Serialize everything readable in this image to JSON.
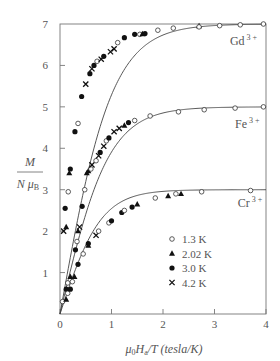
{
  "chart_data": {
    "type": "scatter",
    "title": "",
    "xlabel": "μ0 Ha / T (tesla/K)",
    "ylabel": "M / N μB",
    "xlim": [
      0,
      4
    ],
    "ylim": [
      0,
      7
    ],
    "xticks": [
      0,
      1,
      2,
      3,
      4
    ],
    "yticks": [
      0,
      1,
      2,
      3,
      4,
      5,
      6,
      7
    ],
    "grid": false,
    "legend_position": "lower right (inside)",
    "legend": [
      {
        "label": "1.3 K",
        "marker": "open-circle"
      },
      {
        "label": "2.02 K",
        "marker": "filled-triangle"
      },
      {
        "label": "3.0 K",
        "marker": "filled-circle"
      },
      {
        "label": "4.2 K",
        "marker": "cross"
      }
    ],
    "curves": [
      {
        "name": "Gd 3+",
        "saturation": 7.0,
        "annotation": {
          "text": "Gd",
          "sup": "3 +",
          "x": 3.3,
          "y": 6.5
        }
      },
      {
        "name": "Fe 3+",
        "saturation": 5.0,
        "annotation": {
          "text": "Fe",
          "sup": "3 +",
          "x": 3.4,
          "y": 4.5
        }
      },
      {
        "name": "Cr 3+",
        "saturation": 3.0,
        "annotation": {
          "text": "Cr",
          "sup": "3 +",
          "x": 3.45,
          "y": 2.58
        }
      }
    ],
    "series": [
      {
        "name": "Gd 3+",
        "points": [
          {
            "t": "4.2",
            "x": 0.07,
            "y": 2.0
          },
          {
            "t": "2.02",
            "x": 0.12,
            "y": 2.1
          },
          {
            "t": "3.0",
            "x": 0.1,
            "y": 2.55
          },
          {
            "t": "2.02",
            "x": 0.18,
            "y": 3.4
          },
          {
            "t": "3.0",
            "x": 0.2,
            "y": 3.5
          },
          {
            "t": "1.3",
            "x": 0.16,
            "y": 2.95
          },
          {
            "t": "3.0",
            "x": 0.29,
            "y": 4.4
          },
          {
            "t": "1.3",
            "x": 0.35,
            "y": 4.6
          },
          {
            "t": "3.0",
            "x": 0.42,
            "y": 5.25
          },
          {
            "t": "4.2",
            "x": 0.5,
            "y": 5.55
          },
          {
            "t": "3.0",
            "x": 0.58,
            "y": 5.8
          },
          {
            "t": "4.2",
            "x": 0.62,
            "y": 5.92
          },
          {
            "t": "3.0",
            "x": 0.66,
            "y": 6.0
          },
          {
            "t": "1.3",
            "x": 0.72,
            "y": 6.1
          },
          {
            "t": "4.2",
            "x": 0.8,
            "y": 6.15
          },
          {
            "t": "3.0",
            "x": 0.85,
            "y": 6.22
          },
          {
            "t": "4.2",
            "x": 0.98,
            "y": 6.33
          },
          {
            "t": "4.2",
            "x": 1.05,
            "y": 6.4
          },
          {
            "t": "1.3",
            "x": 1.12,
            "y": 6.55
          },
          {
            "t": "3.0",
            "x": 1.25,
            "y": 6.67
          },
          {
            "t": "3.0",
            "x": 1.45,
            "y": 6.75
          },
          {
            "t": "1.3",
            "x": 1.55,
            "y": 6.75
          },
          {
            "t": "2.02",
            "x": 1.6,
            "y": 6.76
          },
          {
            "t": "3.0",
            "x": 1.65,
            "y": 6.77
          },
          {
            "t": "1.3",
            "x": 1.9,
            "y": 6.85
          },
          {
            "t": "1.3",
            "x": 2.2,
            "y": 6.9
          },
          {
            "t": "2.02",
            "x": 2.7,
            "y": 6.95
          },
          {
            "t": "1.3",
            "x": 2.7,
            "y": 6.93
          },
          {
            "t": "1.3",
            "x": 3.1,
            "y": 6.96
          },
          {
            "t": "1.3",
            "x": 3.5,
            "y": 6.98
          },
          {
            "t": "1.3",
            "x": 3.95,
            "y": 7.0
          }
        ]
      },
      {
        "name": "Fe 3+",
        "points": [
          {
            "t": "1.3",
            "x": 0.05,
            "y": 0.3
          },
          {
            "t": "3.0",
            "x": 0.12,
            "y": 0.6
          },
          {
            "t": "2.02",
            "x": 0.2,
            "y": 0.9
          },
          {
            "t": "1.3",
            "x": 0.15,
            "y": 0.75
          },
          {
            "t": "3.0",
            "x": 0.3,
            "y": 1.55
          },
          {
            "t": "1.3",
            "x": 0.33,
            "y": 1.75
          },
          {
            "t": "2.02",
            "x": 0.35,
            "y": 2.0
          },
          {
            "t": "4.2",
            "x": 0.38,
            "y": 2.1
          },
          {
            "t": "3.0",
            "x": 0.43,
            "y": 2.6
          },
          {
            "t": "1.3",
            "x": 0.48,
            "y": 3.0
          },
          {
            "t": "2.02",
            "x": 0.52,
            "y": 3.4
          },
          {
            "t": "2.02",
            "x": 0.55,
            "y": 3.45
          },
          {
            "t": "1.3",
            "x": 0.6,
            "y": 3.5
          },
          {
            "t": "4.2",
            "x": 0.62,
            "y": 3.6
          },
          {
            "t": "1.3",
            "x": 0.7,
            "y": 3.7
          },
          {
            "t": "4.2",
            "x": 0.75,
            "y": 3.82
          },
          {
            "t": "3.0",
            "x": 0.78,
            "y": 3.9
          },
          {
            "t": "4.2",
            "x": 0.85,
            "y": 4.05
          },
          {
            "t": "1.3",
            "x": 0.9,
            "y": 4.18
          },
          {
            "t": "3.0",
            "x": 0.95,
            "y": 4.25
          },
          {
            "t": "4.2",
            "x": 1.05,
            "y": 4.4
          },
          {
            "t": "4.2",
            "x": 1.15,
            "y": 4.48
          },
          {
            "t": "2.02",
            "x": 1.25,
            "y": 4.55
          },
          {
            "t": "3.0",
            "x": 1.33,
            "y": 4.62
          },
          {
            "t": "1.3",
            "x": 1.45,
            "y": 4.67
          },
          {
            "t": "1.3",
            "x": 1.75,
            "y": 4.78
          },
          {
            "t": "1.3",
            "x": 2.3,
            "y": 4.88
          },
          {
            "t": "1.3",
            "x": 2.8,
            "y": 4.93
          },
          {
            "t": "1.3",
            "x": 3.4,
            "y": 4.97
          },
          {
            "t": "1.3",
            "x": 3.95,
            "y": 5.0
          }
        ]
      },
      {
        "name": "Cr 3+",
        "points": [
          {
            "t": "2.02",
            "x": 0.12,
            "y": 0.35
          },
          {
            "t": "1.3",
            "x": 0.15,
            "y": 0.5
          },
          {
            "t": "3.0",
            "x": 0.2,
            "y": 0.6
          },
          {
            "t": "1.3",
            "x": 0.24,
            "y": 0.78
          },
          {
            "t": "2.02",
            "x": 0.28,
            "y": 0.9
          },
          {
            "t": "3.0",
            "x": 0.35,
            "y": 1.2
          },
          {
            "t": "1.3",
            "x": 0.45,
            "y": 1.45
          },
          {
            "t": "3.0",
            "x": 0.55,
            "y": 1.7
          },
          {
            "t": "2.02",
            "x": 0.55,
            "y": 1.65
          },
          {
            "t": "4.2",
            "x": 0.7,
            "y": 1.9
          },
          {
            "t": "1.3",
            "x": 0.75,
            "y": 2.0
          },
          {
            "t": "1.3",
            "x": 0.95,
            "y": 2.2
          },
          {
            "t": "3.0",
            "x": 1.0,
            "y": 2.25
          },
          {
            "t": "3.0",
            "x": 1.2,
            "y": 2.45
          },
          {
            "t": "1.3",
            "x": 1.25,
            "y": 2.5
          },
          {
            "t": "3.0",
            "x": 1.4,
            "y": 2.58
          },
          {
            "t": "2.02",
            "x": 1.5,
            "y": 2.65
          },
          {
            "t": "1.3",
            "x": 1.85,
            "y": 2.8
          },
          {
            "t": "2.02",
            "x": 2.1,
            "y": 2.85
          },
          {
            "t": "1.3",
            "x": 2.25,
            "y": 2.9
          },
          {
            "t": "2.02",
            "x": 2.35,
            "y": 2.9
          },
          {
            "t": "1.3",
            "x": 2.75,
            "y": 2.95
          },
          {
            "t": "1.3",
            "x": 3.7,
            "y": 2.98
          }
        ]
      }
    ]
  },
  "axis": {
    "ylabel_num": "M",
    "ylabel_den": "N μ",
    "ylabel_den_sub": "B",
    "xlabel_mu": "μ",
    "xlabel_mu_sub": "0",
    "xlabel_H": "H",
    "xlabel_H_sub": "a",
    "xlabel_rest": "/T (tesla/K)"
  }
}
